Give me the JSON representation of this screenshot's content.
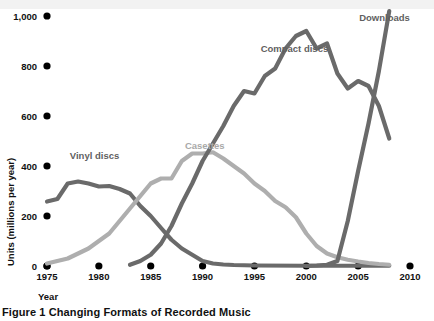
{
  "caption": "Figure 1 Changing Formats of Recorded Music",
  "axes": {
    "ylabel": "Units (millions per year)",
    "xlabel": "Year"
  },
  "chart_data": {
    "type": "line",
    "title": "Figure 1 Changing Formats of Recorded Music",
    "xlabel": "Year",
    "ylabel": "Units (millions per year)",
    "xlim": [
      1975,
      2010
    ],
    "ylim": [
      0,
      1000
    ],
    "xticks": [
      1975,
      1980,
      1985,
      1990,
      1995,
      2000,
      2005,
      2010
    ],
    "xticklabels": [
      "1975",
      "1980",
      "1985",
      "1990",
      "1995",
      "2000",
      "2005",
      "2010"
    ],
    "yticks": [
      0,
      200,
      400,
      600,
      800,
      1000
    ],
    "yticklabels": [
      "0",
      "200",
      "400",
      "600",
      "800",
      "1,000"
    ],
    "grid": false,
    "legend": "inline-annotations",
    "colors": {
      "vinyl": "#6a6a6a",
      "cassettes": "#aeaeae",
      "compact_discs": "#6a6a6a",
      "downloads": "#6a6a6a",
      "tick_dot": "#000000",
      "text": "#111111",
      "label_dark": "#5f5f5f",
      "label_light": "#a9a9a9",
      "top_band": "#f2f2f2"
    },
    "annotations": [
      {
        "name": "vinyl-label",
        "text": "Vinyl discs",
        "x": 1977.2,
        "y": 430,
        "tone": "dark"
      },
      {
        "name": "cassettes-label",
        "text": "Casettes",
        "x": 1988.3,
        "y": 470,
        "tone": "light"
      },
      {
        "name": "compact-discs-label",
        "text": "Compact discs",
        "x": 1995.6,
        "y": 855,
        "tone": "dark"
      },
      {
        "name": "downloads-label",
        "text": "Downloads",
        "x": 2005.1,
        "y": 980,
        "tone": "dark"
      }
    ],
    "series": [
      {
        "name": "Vinyl discs",
        "color": "#6a6a6a",
        "x": [
          1975,
          1976,
          1977,
          1978,
          1979,
          1980,
          1981,
          1982,
          1983,
          1984,
          1985,
          1986,
          1987,
          1988,
          1989,
          1990,
          1991,
          1992,
          1993,
          1994,
          1995,
          2000,
          2005,
          2008
        ],
        "values": [
          258,
          268,
          330,
          338,
          330,
          318,
          320,
          308,
          290,
          240,
          200,
          152,
          105,
          70,
          45,
          20,
          10,
          6,
          4,
          3,
          2,
          1,
          1,
          1
        ]
      },
      {
        "name": "Casettes",
        "color": "#aeaeae",
        "x": [
          1975,
          1977,
          1979,
          1981,
          1983,
          1985,
          1986,
          1987,
          1988,
          1989,
          1990,
          1991,
          1992,
          1993,
          1994,
          1995,
          1996,
          1997,
          1998,
          1999,
          2000,
          2001,
          2002,
          2003,
          2004,
          2005,
          2006,
          2007,
          2008
        ],
        "values": [
          10,
          30,
          70,
          130,
          230,
          330,
          350,
          350,
          420,
          450,
          450,
          455,
          430,
          400,
          370,
          330,
          300,
          260,
          235,
          195,
          130,
          80,
          50,
          35,
          25,
          18,
          12,
          8,
          5
        ]
      },
      {
        "name": "Compact discs",
        "color": "#6a6a6a",
        "x": [
          1983,
          1984,
          1985,
          1986,
          1987,
          1988,
          1989,
          1990,
          1991,
          1992,
          1993,
          1994,
          1995,
          1996,
          1997,
          1998,
          1999,
          2000,
          2001,
          2002,
          2003,
          2004,
          2005,
          2006,
          2007,
          2008
        ],
        "values": [
          5,
          20,
          45,
          90,
          160,
          250,
          330,
          420,
          490,
          560,
          640,
          700,
          690,
          760,
          790,
          870,
          920,
          940,
          870,
          890,
          770,
          710,
          740,
          720,
          640,
          510
        ]
      },
      {
        "name": "Downloads",
        "color": "#6a6a6a",
        "x": [
          2000,
          2001,
          2002,
          2003,
          2004,
          2005,
          2006,
          2007,
          2008
        ],
        "values": [
          0,
          2,
          5,
          20,
          180,
          380,
          570,
          780,
          1020
        ]
      }
    ]
  }
}
